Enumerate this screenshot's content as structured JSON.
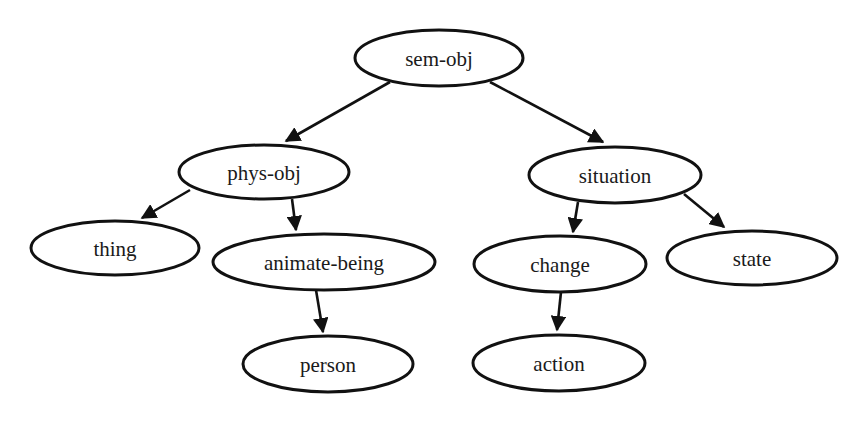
{
  "diagram": {
    "type": "tree",
    "title": "",
    "colors": {
      "stroke": "#111111",
      "fill": "#ffffff",
      "text": "#1a1a1a"
    },
    "nodes": [
      {
        "id": "sem-obj",
        "label": "sem-obj",
        "cx": 439,
        "cy": 58,
        "rx": 84,
        "ry": 28
      },
      {
        "id": "phys-obj",
        "label": "phys-obj",
        "cx": 264,
        "cy": 172,
        "rx": 85,
        "ry": 27
      },
      {
        "id": "situation",
        "label": "situation",
        "cx": 615,
        "cy": 175,
        "rx": 86,
        "ry": 28
      },
      {
        "id": "thing",
        "label": "thing",
        "cx": 115,
        "cy": 248,
        "rx": 84,
        "ry": 27
      },
      {
        "id": "animate-being",
        "label": "animate-being",
        "cx": 324,
        "cy": 262,
        "rx": 111,
        "ry": 28
      },
      {
        "id": "change",
        "label": "change",
        "cx": 560,
        "cy": 264,
        "rx": 86,
        "ry": 28
      },
      {
        "id": "state",
        "label": "state",
        "cx": 752,
        "cy": 258,
        "rx": 85,
        "ry": 27
      },
      {
        "id": "person",
        "label": "person",
        "cx": 328,
        "cy": 364,
        "rx": 85,
        "ry": 28
      },
      {
        "id": "action",
        "label": "action",
        "cx": 559,
        "cy": 363,
        "rx": 86,
        "ry": 28
      }
    ],
    "edges": [
      {
        "from": "sem-obj",
        "to": "phys-obj",
        "x1": 390,
        "y1": 82,
        "x2": 286,
        "y2": 141
      },
      {
        "from": "sem-obj",
        "to": "situation",
        "x1": 490,
        "y1": 82,
        "x2": 603,
        "y2": 142
      },
      {
        "from": "phys-obj",
        "to": "thing",
        "x1": 190,
        "y1": 190,
        "x2": 142,
        "y2": 218
      },
      {
        "from": "phys-obj",
        "to": "animate-being",
        "x1": 292,
        "y1": 199,
        "x2": 296,
        "y2": 230
      },
      {
        "from": "situation",
        "to": "change",
        "x1": 578,
        "y1": 202,
        "x2": 573,
        "y2": 232
      },
      {
        "from": "situation",
        "to": "state",
        "x1": 684,
        "y1": 194,
        "x2": 724,
        "y2": 227
      },
      {
        "from": "animate-being",
        "to": "person",
        "x1": 316,
        "y1": 290,
        "x2": 323,
        "y2": 332
      },
      {
        "from": "change",
        "to": "action",
        "x1": 561,
        "y1": 292,
        "x2": 557,
        "y2": 330
      }
    ]
  }
}
